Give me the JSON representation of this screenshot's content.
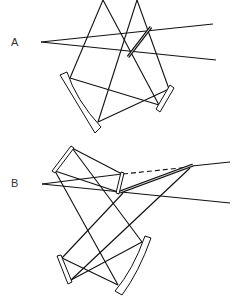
{
  "diagram": {
    "panels": [
      {
        "label": "A",
        "description": "Optical layout: entrance rays from point, concave mirror, flat mirror, grating"
      },
      {
        "label": "B",
        "description": "Optical layout: folding mirror, concave mirror, flat mirror, grating with dashed beam"
      }
    ],
    "colors": {
      "line": "#111111",
      "background": "#ffffff"
    }
  }
}
